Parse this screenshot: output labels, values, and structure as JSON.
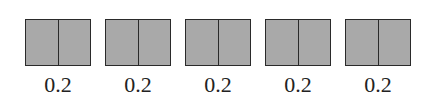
{
  "diagram": {
    "fill_color": "#a9a9a9",
    "stroke_color": "#2a2a2a",
    "items": [
      {
        "label": "0.2",
        "parts": 2
      },
      {
        "label": "0.2",
        "parts": 2
      },
      {
        "label": "0.2",
        "parts": 2
      },
      {
        "label": "0.2",
        "parts": 2
      },
      {
        "label": "0.2",
        "parts": 2
      }
    ]
  }
}
